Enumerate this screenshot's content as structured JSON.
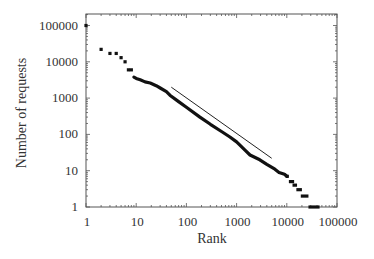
{
  "chart_data": {
    "type": "scatter",
    "title": "",
    "xlabel": "Rank",
    "ylabel": "Number of requests",
    "xscale": "log",
    "yscale": "log",
    "xlim": [
      1,
      100000
    ],
    "ylim": [
      1,
      200000
    ],
    "x_ticks": [
      "1",
      "10",
      "100",
      "1000",
      "10000",
      "100000"
    ],
    "y_ticks": [
      "1",
      "10",
      "100",
      "1000",
      "10000",
      "100000"
    ],
    "grid": false,
    "legend": null,
    "series": [
      {
        "name": "Requests per rank",
        "style": "dense markers",
        "points": [
          [
            1,
            100000
          ],
          [
            2,
            22000
          ],
          [
            3,
            17000
          ],
          [
            4,
            17000
          ],
          [
            5,
            13000
          ],
          [
            6,
            10000
          ],
          [
            7,
            6000
          ],
          [
            8,
            6000
          ],
          [
            9,
            3800
          ],
          [
            10,
            3500
          ],
          [
            12,
            3200
          ],
          [
            15,
            2800
          ],
          [
            19,
            2600
          ],
          [
            25,
            2200
          ],
          [
            30,
            1900
          ],
          [
            40,
            1500
          ],
          [
            47,
            1200
          ],
          [
            70,
            800
          ],
          [
            100,
            560
          ],
          [
            186,
            300
          ],
          [
            300,
            190
          ],
          [
            500,
            120
          ],
          [
            735,
            85
          ],
          [
            1000,
            62
          ],
          [
            1470,
            37
          ],
          [
            1850,
            27
          ],
          [
            2900,
            20
          ],
          [
            4000,
            15
          ],
          [
            5800,
            11
          ],
          [
            7000,
            9
          ],
          [
            9000,
            8
          ],
          [
            10000,
            7
          ],
          [
            12000,
            6
          ],
          [
            13500,
            5
          ],
          [
            15000,
            4
          ],
          [
            18000,
            3
          ],
          [
            22000,
            2
          ],
          [
            26000,
            1
          ],
          [
            45000,
            1
          ]
        ],
        "steps": [
          {
            "value": 7,
            "rank_from": 9500,
            "rank_to": 11000
          },
          {
            "value": 5,
            "rank_from": 11000,
            "rank_to": 14000
          },
          {
            "value": 4,
            "rank_from": 13000,
            "rank_to": 16000
          },
          {
            "value": 3,
            "rank_from": 15500,
            "rank_to": 20000
          },
          {
            "value": 2,
            "rank_from": 19000,
            "rank_to": 27000
          },
          {
            "value": 1,
            "rank_from": 27000,
            "rank_to": 45000
          }
        ]
      },
      {
        "name": "Reference power-law line (slope ≈ -1)",
        "style": "thin line",
        "points": [
          [
            50,
            2000
          ],
          [
            5000,
            22
          ]
        ]
      }
    ]
  }
}
